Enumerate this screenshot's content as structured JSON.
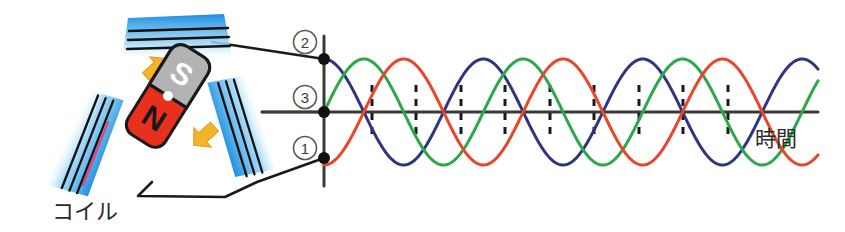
{
  "figure": {
    "title_visible": false,
    "background": "#ffffff"
  },
  "labels": {
    "coil": "コイル",
    "time_axis": "時間",
    "terminal_1": "1",
    "terminal_2": "2",
    "terminal_3": "3",
    "magnet_north": "N",
    "magnet_south": "S"
  },
  "colors": {
    "phase_red": "#e8452a",
    "phase_green": "#2ba84a",
    "phase_blue": "#30357f",
    "coil_blue_dark": "#1b6fc4",
    "coil_blue_light": "#8fd0f5",
    "magnet_north_fill": "#e8301d",
    "magnet_south_fill": "#b3b3b3",
    "arrow_yellow": "#f5b32a",
    "wire_black": "#1a1a1a",
    "axis_black": "#3b3b33",
    "pointer_pink": "#e8407a",
    "text_dark": "#2b2b2b"
  },
  "chart_data": {
    "type": "line",
    "title": "",
    "xlabel": "時間",
    "ylabel": "",
    "grid": false,
    "legend_position": "none",
    "xlim": [
      0,
      3.1
    ],
    "ylim": [
      -1.15,
      1.15
    ],
    "x_unit": "cycles",
    "tick_count": 13,
    "tick_style": "dashed-vertical",
    "series": [
      {
        "name": "phase-1",
        "terminal": "1",
        "color": "#e8452a",
        "phase_deg": 270,
        "amplitude": 1,
        "cycles": 3,
        "start_value": -1
      },
      {
        "name": "phase-2",
        "terminal": "2",
        "color": "#30357f",
        "phase_deg": 90,
        "amplitude": 1,
        "cycles": 3,
        "start_value": 1
      },
      {
        "name": "phase-3",
        "terminal": "3",
        "color": "#2ba84a",
        "phase_deg": 0,
        "amplitude": 1,
        "cycles": 3,
        "start_value": 0
      }
    ]
  },
  "diagram": {
    "coils": [
      {
        "name": "coil-top",
        "position": "top"
      },
      {
        "name": "coil-left",
        "position": "left"
      },
      {
        "name": "coil-right",
        "position": "right"
      }
    ],
    "magnet": {
      "name": "rotating-magnet",
      "rotation_deg": -58
    },
    "rotation_arrows": [
      {
        "name": "rotation-arrow-upper-left",
        "direction": "up-right"
      },
      {
        "name": "rotation-arrow-lower-right",
        "direction": "down-left"
      }
    ]
  }
}
